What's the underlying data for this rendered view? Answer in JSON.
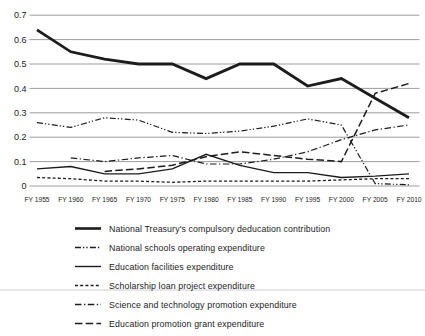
{
  "chart_data": {
    "type": "line",
    "title": "",
    "xlabel": "",
    "ylabel": "",
    "ylim": [
      0,
      0.7
    ],
    "grid": true,
    "legend_position": "bottom-left",
    "y_ticks": [
      "0.7",
      "0.6",
      "0.5",
      "0.4",
      "0.3",
      "0.2",
      "0.1",
      "0"
    ],
    "categories": [
      "FY 1955",
      "FY 1960",
      "FY 1965",
      "FY 1970",
      "FY 1975",
      "FY 1980",
      "FY 1985",
      "FY 1990",
      "FY 1995",
      "FY 2000",
      "FY 2005",
      "FY 2010"
    ],
    "series": [
      {
        "name": "National Treasury's compulsory deducation contribution",
        "line_style": "solid",
        "line_width": "thick",
        "values": [
          0.64,
          0.55,
          0.52,
          0.5,
          0.5,
          0.44,
          0.5,
          0.5,
          0.41,
          0.44,
          0.36,
          0.28
        ]
      },
      {
        "name": "National schools operating expenditure",
        "line_style": "dash-dot-dot",
        "line_width": "thin",
        "values": [
          0.26,
          0.24,
          0.28,
          0.27,
          0.22,
          0.215,
          0.225,
          0.245,
          0.275,
          0.25,
          0.01,
          0.005
        ]
      },
      {
        "name": "Education facilities expenditure",
        "line_style": "solid",
        "line_width": "thin",
        "values": [
          0.07,
          0.08,
          0.05,
          0.05,
          0.07,
          0.13,
          0.085,
          0.055,
          0.055,
          0.035,
          0.04,
          0.05
        ]
      },
      {
        "name": "Scholarship loan project expenditure",
        "line_style": "dashed",
        "line_width": "thin",
        "values": [
          0.035,
          0.03,
          0.02,
          0.02,
          0.015,
          0.02,
          0.02,
          0.02,
          0.02,
          0.025,
          0.03,
          0.03
        ]
      },
      {
        "name": "Science and technology promotion expenditure",
        "line_style": "dash-dot",
        "line_width": "thin",
        "values": [
          null,
          0.115,
          0.1,
          0.115,
          0.125,
          0.09,
          0.09,
          0.11,
          0.14,
          0.19,
          0.23,
          0.25
        ]
      },
      {
        "name": "Education promotion grant expenditure",
        "line_style": "long-dash",
        "line_width": "medium",
        "values": [
          null,
          null,
          0.06,
          0.07,
          0.085,
          0.12,
          0.14,
          0.125,
          0.11,
          0.1,
          0.38,
          0.42
        ]
      }
    ]
  },
  "colors": {
    "line": "#1c1c1c",
    "grid": "#9d9d9d",
    "background": "#ffffff"
  }
}
